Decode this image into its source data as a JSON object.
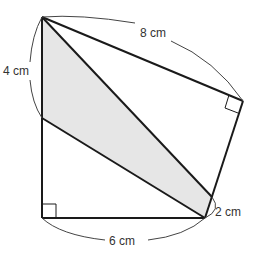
{
  "diagram": {
    "colors": {
      "stroke": "#1a1a1a",
      "shade": "#e6e6e6",
      "arc": "#444444",
      "label": "#333333"
    },
    "labels": {
      "top": "8 cm",
      "left": "4 cm",
      "bottom": "6 cm",
      "right": "2 cm"
    },
    "vertices": {
      "A": [
        42,
        17
      ],
      "B": [
        243,
        101
      ],
      "C": [
        205,
        218
      ],
      "D": [
        212,
        197
      ],
      "E": [
        42,
        118
      ],
      "F": [
        42,
        218
      ]
    },
    "right_angles": [
      "B",
      "F"
    ],
    "shaded_region": [
      "A",
      "E",
      "C",
      "D"
    ]
  }
}
